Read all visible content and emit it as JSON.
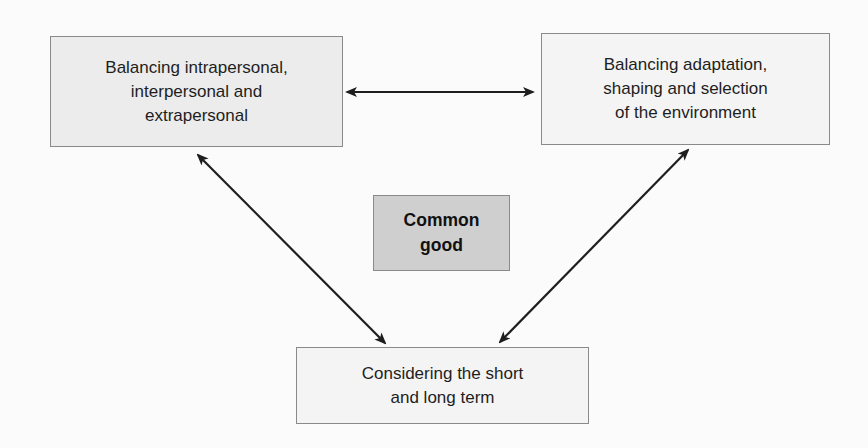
{
  "diagram": {
    "nodes": [
      {
        "id": "balance-personal",
        "label": "Balancing intrapersonal,\ninterpersonal and\nextrapersonal"
      },
      {
        "id": "balance-environment",
        "label": "Balancing adaptation,\nshaping and selection\nof the environment"
      },
      {
        "id": "common-good",
        "label": "Common\ngood"
      },
      {
        "id": "short-long-term",
        "label": "Considering the short\nand long term"
      }
    ],
    "edges": [
      {
        "from": "balance-personal",
        "to": "balance-environment",
        "type": "bidirectional"
      },
      {
        "from": "balance-personal",
        "to": "short-long-term",
        "type": "bidirectional"
      },
      {
        "from": "balance-environment",
        "to": "short-long-term",
        "type": "bidirectional"
      }
    ],
    "colors": {
      "background": "#fbfbfb",
      "box_fill_light": "#ececec",
      "box_fill_center": "#cfcfcf",
      "box_border": "#8a8a8a",
      "arrow": "#1e1e1e"
    }
  }
}
